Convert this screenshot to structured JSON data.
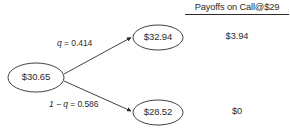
{
  "diagram": {
    "type": "binomial-tree",
    "background": "#ffffff",
    "stroke_color": "#2b2b2b",
    "text_color": "#2b2b2b",
    "root": {
      "label": "$30.65",
      "value": 30.65
    },
    "branches": [
      {
        "direction": "up",
        "probability_label": "q = 0.414",
        "probability_prefix": "q",
        "probability_expression": "= 0.414",
        "probability_value": 0.414,
        "node_label": "$32.94",
        "node_value": 32.94,
        "payoff_label": "$3.94",
        "payoff_value": 3.94
      },
      {
        "direction": "down",
        "probability_label": "1 − q = 0.586",
        "probability_prefix": "1 − q",
        "probability_expression": "= 0.586",
        "probability_value": 0.586,
        "node_label": "$28.52",
        "node_value": 28.52,
        "payoff_label": "$0",
        "payoff_value": 0
      }
    ],
    "payoffs_header": "Payoffs on Call@$29",
    "strike": 29
  }
}
